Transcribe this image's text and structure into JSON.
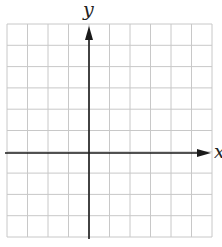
{
  "diagram": {
    "type": "coordinate-grid",
    "labels": {
      "x_axis": "x",
      "y_axis": "y"
    },
    "grid": {
      "columns": 10,
      "rows": 10,
      "left": 7,
      "top": 24,
      "right": 212,
      "bottom": 237,
      "line_color": "#c8c8c8",
      "y_axis_column_index": 4,
      "x_axis_row_index": 6
    },
    "axes": {
      "color": "#1a1a1a",
      "y_axis_x": 89,
      "x_axis_y": 153,
      "y_arrow": "up",
      "x_arrow": "right"
    }
  }
}
